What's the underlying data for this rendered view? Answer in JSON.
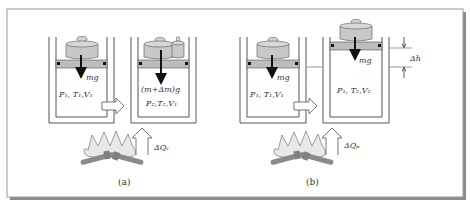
{
  "figure": {
    "panels": [
      {
        "id": "a",
        "caption": "(a)",
        "left_cylinder": {
          "force_label": "mg",
          "state_label": "P₁, T₁,V₁"
        },
        "right_cylinder": {
          "force_label": "(m+Δm)g",
          "state_label": "P₂,T₂,V₁"
        },
        "heat_label": "ΔQᵥ",
        "process": "isochoric"
      },
      {
        "id": "b",
        "caption": "(b)",
        "left_cylinder": {
          "force_label": "mg",
          "state_label": "P₁, T₁,V₁"
        },
        "right_cylinder": {
          "force_label": "mg",
          "state_label": "P₁, T₂,V₂"
        },
        "heat_label": "ΔQₚ",
        "height_change_label": "Δh",
        "process": "isobaric"
      }
    ]
  },
  "colors": {
    "border": "#9a9a9a",
    "shadow": "#8c8c8c",
    "wall": "#ffffff",
    "wall_stroke": "#555555",
    "weight": "#c8c8c8",
    "piston": "#bdbdbd",
    "stop": "#111111",
    "flame": "#e6e6e6",
    "log": "#8a8a8a",
    "arrow": "#111111"
  }
}
